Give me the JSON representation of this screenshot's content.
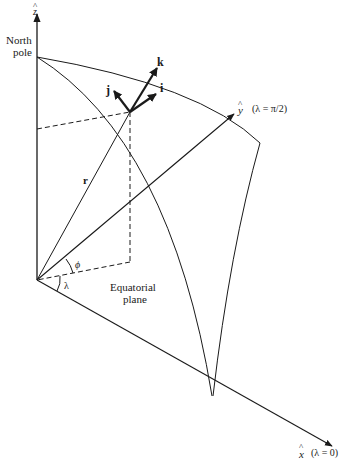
{
  "diagram": {
    "type": "spherical-coordinate-geometry",
    "axes": {
      "z": {
        "label": "ẑ",
        "hat_symbol": "^",
        "letter": "z"
      },
      "y": {
        "label": "ŷ",
        "hat_symbol": "^",
        "letter": "y",
        "annotation": "(λ = π/2)"
      },
      "x": {
        "label": "x̂",
        "hat_symbol": "^",
        "letter": "x",
        "annotation": "(λ = 0)"
      }
    },
    "labels": {
      "north_pole_line1": "North",
      "north_pole_line2": "pole",
      "equatorial_line1": "Equatorial",
      "equatorial_line2": "plane",
      "position_vector": "r",
      "latitude_angle": "ϕ",
      "longitude_angle": "λ"
    },
    "unit_vectors": [
      {
        "name": "i",
        "label": "i"
      },
      {
        "name": "j",
        "label": "j"
      },
      {
        "name": "k",
        "label": "k"
      }
    ],
    "colors": {
      "line": "#1a1a1a",
      "background": "#ffffff"
    }
  }
}
